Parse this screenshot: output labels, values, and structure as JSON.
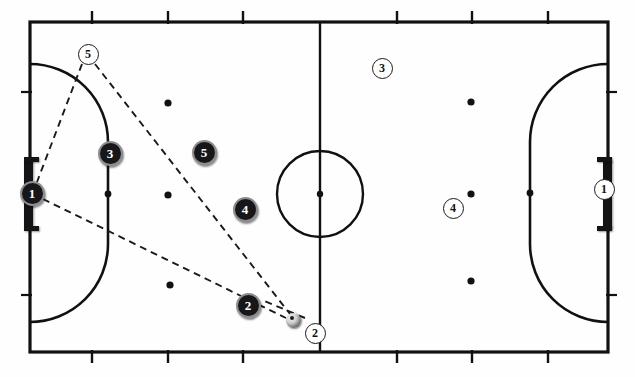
{
  "diagram": {
    "sport": "futsal",
    "pitch": {
      "outline_color": "#111111",
      "line_color": "#111111",
      "background_color": "#ffffff",
      "left": 30,
      "top": 22,
      "right": 608,
      "bottom": 352,
      "halfway_line_x": 320,
      "center_spot": {
        "x": 320,
        "y": 194
      },
      "center_circle": {
        "cx": 320,
        "cy": 194,
        "r": 43
      },
      "penalty_area_left": {
        "goal_line_x": 30,
        "depth": 78,
        "top_y": 64,
        "bottom_y": 322
      },
      "penalty_area_right": {
        "goal_line_x": 608,
        "depth": 78,
        "top_y": 64,
        "bottom_y": 322
      },
      "second_penalty_spot_left": {
        "x": 108,
        "y": 194
      },
      "second_penalty_spot_right": {
        "x": 530,
        "y": 193
      },
      "substitution_ticks_top": [
        92,
        168,
        243,
        397,
        472,
        548
      ],
      "substitution_ticks_bottom": [
        92,
        168,
        243,
        397,
        472,
        548
      ],
      "side_ticks_left": [
        92,
        295
      ],
      "side_ticks_right": [
        92,
        295
      ]
    },
    "goals": [
      {
        "name": "left-goal",
        "side": "left",
        "x": 24,
        "y": 160,
        "width": 9,
        "height": 68
      },
      {
        "name": "right-goal",
        "side": "right",
        "x": 603,
        "y": 160,
        "width": 9,
        "height": 68
      }
    ],
    "markers": [
      {
        "id": "m1",
        "x": 168,
        "y": 103
      },
      {
        "id": "m2",
        "x": 168,
        "y": 195
      },
      {
        "id": "m3",
        "x": 170,
        "y": 285
      },
      {
        "id": "m4",
        "x": 471,
        "y": 102
      },
      {
        "id": "m5",
        "x": 471,
        "y": 194
      },
      {
        "id": "m6",
        "x": 471,
        "y": 281
      }
    ],
    "teams": {
      "dark": {
        "name": "Attacking team",
        "fill": "#17171a",
        "text": "#ffffff"
      },
      "light": {
        "name": "Defending team",
        "fill": "#ffffff",
        "text": "#111111"
      }
    },
    "players": [
      {
        "team": "dark",
        "number": "1",
        "x": 32,
        "y": 193,
        "role": "goalkeeper",
        "size": "big"
      },
      {
        "team": "dark",
        "number": "3",
        "x": 110,
        "y": 153,
        "role": "defender",
        "size": "big"
      },
      {
        "team": "dark",
        "number": "5",
        "x": 204,
        "y": 152,
        "role": "winger",
        "size": "big"
      },
      {
        "team": "dark",
        "number": "4",
        "x": 245,
        "y": 209,
        "role": "pivot",
        "size": "big"
      },
      {
        "team": "dark",
        "number": "2",
        "x": 248,
        "y": 305,
        "role": "winger",
        "size": "big"
      },
      {
        "team": "light",
        "number": "5",
        "x": 88,
        "y": 54,
        "role": "presser",
        "size": "sm"
      },
      {
        "team": "light",
        "number": "3",
        "x": 382,
        "y": 68,
        "role": "defender",
        "size": "sm"
      },
      {
        "team": "light",
        "number": "4",
        "x": 453,
        "y": 208,
        "role": "defender",
        "size": "sm"
      },
      {
        "team": "light",
        "number": "2",
        "x": 315,
        "y": 333,
        "role": "presser",
        "size": "sm"
      },
      {
        "team": "light",
        "number": "1",
        "x": 604,
        "y": 189,
        "role": "goalkeeper",
        "size": "sm"
      }
    ],
    "ball": {
      "x": 293,
      "y": 320,
      "label": "ball"
    },
    "pass_lines": [
      {
        "name": "press-line-keeper",
        "x1": 82,
        "y1": 64,
        "x2": 37,
        "y2": 182,
        "style": "dashed"
      },
      {
        "name": "press-line-ball",
        "x1": 95,
        "y1": 64,
        "x2": 290,
        "y2": 314,
        "style": "dashed"
      },
      {
        "name": "pass-keeper-ball",
        "x1": 43,
        "y1": 199,
        "x2": 286,
        "y2": 318,
        "style": "dashed"
      },
      {
        "name": "cover-line-ball",
        "x1": 305,
        "y1": 318,
        "x2": 262,
        "y2": 300,
        "style": "dashed"
      }
    ]
  }
}
